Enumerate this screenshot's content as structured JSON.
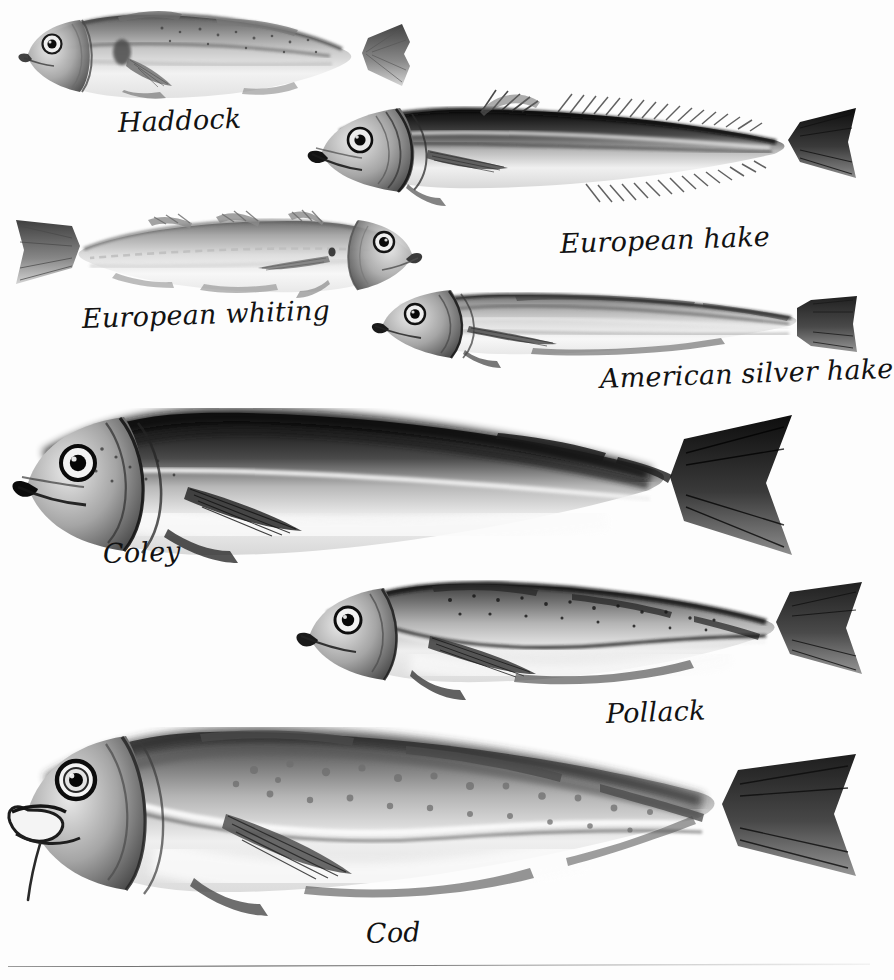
{
  "plate": {
    "title": "Cod family fish identification plate",
    "background_color": "#fdfdfd",
    "ink_color": "#121212",
    "medium": "monochrome airbrush / wash illustration",
    "figure_count": 7
  },
  "species": [
    {
      "id": "haddock",
      "label": "Haddock",
      "facing": "left",
      "label_x": 118,
      "label_y": 107,
      "label_size": 27,
      "label_rotate": -2,
      "fish_x": 10,
      "fish_y": 8,
      "fish_w": 440,
      "fish_h": 100,
      "notes": "dark shoulder blotch above pectoral fin, dark lateral line, speckled back"
    },
    {
      "id": "european-hake",
      "label": "European hake",
      "facing": "left",
      "label_x": 560,
      "label_y": 228,
      "label_size": 27,
      "label_rotate": -2,
      "fish_x": 300,
      "fish_y": 88,
      "fish_w": 570,
      "fish_h": 125,
      "notes": "very dark back, long spiny dorsal and anal fins, deeply forked dark tail"
    },
    {
      "id": "european-whiting",
      "label": "European whiting",
      "facing": "right",
      "label_x": 82,
      "label_y": 303,
      "label_size": 27,
      "label_rotate": -2,
      "fish_x": 8,
      "fish_y": 208,
      "fish_w": 420,
      "fish_h": 95,
      "notes": "pale silvery body, three separate dorsal fins, faces right"
    },
    {
      "id": "american-silver-hake",
      "label": "American silver hake",
      "facing": "left",
      "label_x": 600,
      "label_y": 363,
      "label_size": 27,
      "label_rotate": -2,
      "fish_x": 365,
      "fish_y": 280,
      "fish_w": 500,
      "fish_h": 88,
      "notes": "slender, silvery, dark stripe along back, squared tail"
    },
    {
      "id": "coley",
      "label": "Coley",
      "facing": "left",
      "label_x": 103,
      "label_y": 538,
      "label_size": 27,
      "label_rotate": -2,
      "fish_x": 6,
      "fish_y": 405,
      "fish_w": 800,
      "fish_h": 165,
      "notes": "largest figure, very dark back, deep body, pale belly, black forked tail"
    },
    {
      "id": "pollack",
      "label": "Pollack",
      "facing": "left",
      "label_x": 606,
      "label_y": 698,
      "label_size": 27,
      "label_rotate": -2,
      "fish_x": 290,
      "fish_y": 570,
      "fish_w": 585,
      "fish_h": 130,
      "notes": "speckled upper flank, strongly curved lateral line, three dorsal fins"
    },
    {
      "id": "cod",
      "label": "Cod",
      "facing": "left",
      "label_x": 366,
      "label_y": 918,
      "label_size": 27,
      "label_rotate": -2,
      "fish_x": 4,
      "fish_y": 718,
      "fish_w": 870,
      "fish_h": 200,
      "notes": "open mouth, chin barbel, mottled spots, pale curved lateral line"
    }
  ],
  "rule": {
    "present": true,
    "description": "thin slightly-slanted ink rule across the foot of the plate, heavier at left and fading to the right"
  }
}
